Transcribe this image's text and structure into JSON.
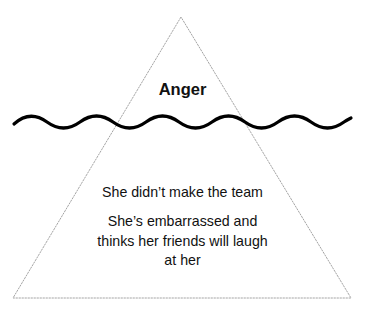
{
  "diagram": {
    "type": "iceberg",
    "above_water": {
      "label": "Anger"
    },
    "below_water": {
      "items": [
        "She didn’t make the team",
        "She’s embarrassed and thinks her friends will laugh at her"
      ],
      "item_2_lines": [
        "She’s embarrassed and",
        "thinks her friends will laugh",
        "at her"
      ]
    },
    "colors": {
      "triangle_stroke": "#9a9a9a",
      "wave_stroke": "#000000",
      "text": "#111111",
      "background": "#ffffff"
    }
  }
}
